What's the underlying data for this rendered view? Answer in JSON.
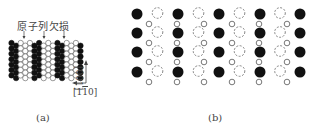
{
  "panel_a": {
    "caption": "(a)",
    "annotation": "原子列欠损",
    "axis_vertical": "[001]",
    "axis_horizontal_pre": "[1",
    "axis_horizontal_bar": "1",
    "axis_horizontal_post": "0]",
    "grid": {
      "x0": 11.5,
      "col_spacing": 4.6,
      "cols": 16,
      "y0": 43,
      "row_spacing": 5.4,
      "rows": 7,
      "radius": 2.7,
      "black_columns": [
        0,
        1,
        5,
        6,
        10,
        11,
        15
      ],
      "missing_row_arrows_x": [
        24,
        44,
        64
      ]
    }
  },
  "panel_b": {
    "caption": "(b)",
    "large_columns_x": [
      137,
      178,
      219,
      260,
      300
    ],
    "large_pattern": [
      "black",
      "dashed",
      "black",
      "dashed",
      "black",
      "dashed",
      "black"
    ],
    "large_rows_y": [
      14,
      33,
      52,
      72
    ],
    "small_columns_x": [
      149,
      177,
      204,
      232,
      259,
      287
    ],
    "small_rows_y": [
      24,
      43,
      62,
      82
    ]
  },
  "colors": {
    "black_atom": "#111111",
    "outline": "#555555"
  }
}
